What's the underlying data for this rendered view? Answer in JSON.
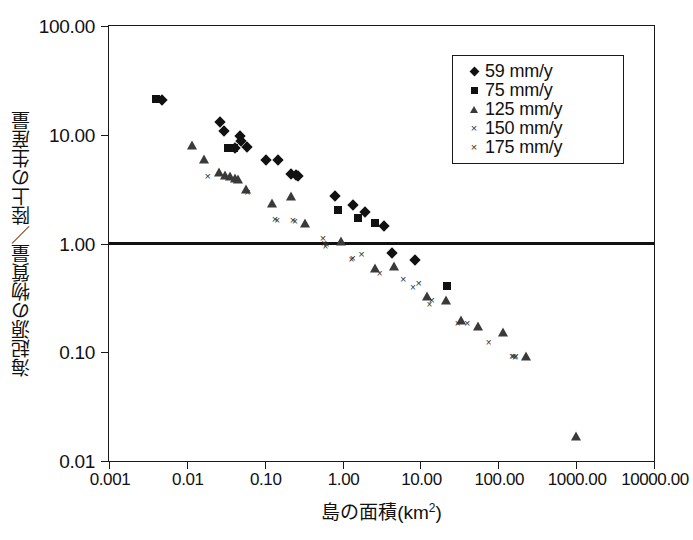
{
  "chart_data": {
    "type": "scatter",
    "title": "",
    "xlabel": "島の面積(km2)",
    "xlabel_base": "島の面積(km",
    "xlabel_sup": "2",
    "xlabel_tail": ")",
    "ylabel": "海起源の物質量／陸上の生産量",
    "xscale": "log",
    "yscale": "log",
    "xlim": [
      0.001,
      10000.0
    ],
    "ylim": [
      0.01,
      100.0
    ],
    "grid": false,
    "xticks": [
      0.001,
      0.01,
      0.1,
      1.0,
      10.0,
      100.0,
      1000.0,
      10000.0
    ],
    "xtick_labels": [
      "0.001",
      "0.01",
      "0.10",
      "1.00",
      "10.00",
      "100.00",
      "1000.00",
      "10000.00"
    ],
    "yticks": [
      0.01,
      0.1,
      1.0,
      10.0,
      100.0
    ],
    "ytick_labels": [
      "0.01",
      "0.10",
      "1.00",
      "10.00",
      "100.00"
    ],
    "reference_line": {
      "y": 1.0,
      "style": "solid-thick",
      "color": "#111111"
    },
    "legend_position": "top-right",
    "series": [
      {
        "name": "59 mm/y",
        "marker": "diamond",
        "color": "#111111",
        "points": [
          [
            0.0048,
            21.0
          ],
          [
            0.027,
            13.0
          ],
          [
            0.03,
            10.8
          ],
          [
            0.048,
            9.8
          ],
          [
            0.05,
            8.8
          ],
          [
            0.041,
            7.6
          ],
          [
            0.06,
            7.7
          ],
          [
            0.105,
            5.9
          ],
          [
            0.15,
            5.9
          ],
          [
            0.215,
            4.4
          ],
          [
            0.255,
            4.3
          ],
          [
            0.27,
            4.2
          ],
          [
            0.8,
            2.75
          ],
          [
            1.35,
            2.25
          ],
          [
            1.95,
            1.95
          ],
          [
            3.4,
            1.45
          ],
          [
            4.3,
            0.82
          ],
          [
            8.5,
            0.7
          ]
        ]
      },
      {
        "name": "75 mm/y",
        "marker": "square",
        "color": "#111111",
        "points": [
          [
            0.004,
            21.5
          ],
          [
            0.034,
            7.6
          ],
          [
            0.04,
            7.6
          ],
          [
            0.88,
            2.05
          ],
          [
            1.6,
            1.72
          ],
          [
            2.6,
            1.55
          ],
          [
            22.0,
            0.41
          ]
        ]
      },
      {
        "name": "125 mm/y",
        "marker": "triangle",
        "color": "#3a3a3a",
        "points": [
          [
            0.0115,
            8.0
          ],
          [
            0.0165,
            6.0
          ],
          [
            0.0255,
            4.5
          ],
          [
            0.031,
            4.3
          ],
          [
            0.036,
            4.2
          ],
          [
            0.042,
            4.0
          ],
          [
            0.046,
            3.9
          ],
          [
            0.058,
            3.2
          ],
          [
            0.125,
            2.35
          ],
          [
            0.215,
            2.75
          ],
          [
            0.33,
            1.55
          ],
          [
            0.95,
            1.05
          ],
          [
            2.6,
            0.6
          ],
          [
            4.6,
            0.62
          ],
          [
            12.0,
            0.33
          ],
          [
            21.0,
            0.3
          ],
          [
            33.0,
            0.2
          ],
          [
            55.0,
            0.175
          ],
          [
            115.0,
            0.155
          ],
          [
            230.0,
            0.093
          ],
          [
            1000.0,
            0.017
          ]
        ]
      },
      {
        "name": "150 mm/y",
        "marker": "cross",
        "color": "#333333",
        "points": [
          [
            0.0185,
            4.15
          ],
          [
            0.06,
            3.0
          ],
          [
            0.135,
            1.68
          ],
          [
            0.23,
            1.65
          ],
          [
            0.56,
            1.12
          ],
          [
            0.62,
            0.98
          ],
          [
            1.35,
            0.73
          ],
          [
            1.75,
            0.8
          ],
          [
            6.0,
            0.47
          ],
          [
            9.5,
            0.43
          ],
          [
            14.0,
            0.3
          ],
          [
            40.0,
            0.185
          ],
          [
            155.0,
            0.093
          ],
          [
            168.0,
            0.092
          ]
        ]
      },
      {
        "name": "175 mm/y",
        "marker": "cross-small",
        "color": "#333333",
        "points": [
          [
            0.145,
            1.65
          ],
          [
            0.245,
            1.62
          ],
          [
            0.58,
            1.02
          ],
          [
            0.6,
            0.94
          ],
          [
            1.3,
            0.72
          ],
          [
            3.0,
            0.53
          ],
          [
            8.0,
            0.4
          ],
          [
            13.0,
            0.28
          ],
          [
            30.0,
            0.185
          ],
          [
            75.0,
            0.125
          ],
          [
            150.0,
            0.092
          ],
          [
            165.0,
            0.091
          ]
        ]
      }
    ]
  },
  "legend": {
    "items": [
      {
        "label": "59 mm/y",
        "marker": "diamond"
      },
      {
        "label": "75 mm/y",
        "marker": "square"
      },
      {
        "label": "125 mm/y",
        "marker": "triangle"
      },
      {
        "label": "150 mm/y",
        "marker": "cross"
      },
      {
        "label": "175 mm/y",
        "marker": "cross-small"
      }
    ]
  }
}
